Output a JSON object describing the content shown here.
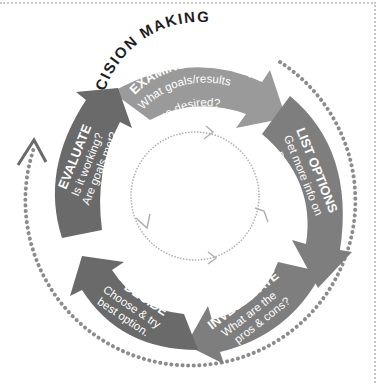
{
  "title": "DECISION MAKING",
  "colors": {
    "arrow_light": "#9a9a9a",
    "arrow_mid": "#7e7e7e",
    "arrow_dark": "#6a6a6a",
    "dots": "#8c8c8c",
    "inner_cycle": "#b0b0b0",
    "title": "#1e1e1e",
    "frame": "#c8c8c8"
  },
  "steps": [
    {
      "heading": "EXAMINE DECISION",
      "line1": "What goals/results",
      "line2": "are desired?"
    },
    {
      "heading": "LIST OPTIONS",
      "line1": "Get more info on",
      "line2": "possibilities."
    },
    {
      "heading": "INVESTIGATE",
      "line1": "What are the",
      "line2": "pros & cons?"
    },
    {
      "heading": "DECIDE",
      "line1": "Choose & try",
      "line2": "best option."
    },
    {
      "heading": "EVALUATE",
      "line1": "Is it working?",
      "line2": "Are goals met?"
    }
  ]
}
